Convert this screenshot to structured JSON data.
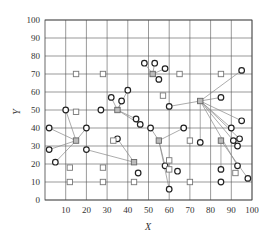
{
  "chart_data": {
    "type": "scatter",
    "title": "",
    "xlabel": "X",
    "ylabel": "Y",
    "xlim": [
      0,
      100
    ],
    "ylim": [
      0,
      100
    ],
    "x_ticks": [
      10,
      20,
      30,
      40,
      50,
      60,
      70,
      80,
      90,
      100
    ],
    "y_ticks": [
      0,
      10,
      20,
      30,
      40,
      50,
      60,
      70,
      80,
      90,
      100
    ],
    "grid": true,
    "legend": null,
    "series": [
      {
        "name": "demand points (circles)",
        "marker": "circle",
        "points": [
          [
            2,
            40
          ],
          [
            2,
            28
          ],
          [
            5,
            21
          ],
          [
            10,
            50
          ],
          [
            20,
            40
          ],
          [
            20,
            28
          ],
          [
            27,
            50
          ],
          [
            32,
            57
          ],
          [
            35,
            34
          ],
          [
            37,
            55
          ],
          [
            40,
            61
          ],
          [
            44,
            45
          ],
          [
            45,
            15
          ],
          [
            46,
            42
          ],
          [
            48,
            76
          ],
          [
            51,
            40
          ],
          [
            53,
            76
          ],
          [
            55,
            67
          ],
          [
            58,
            73
          ],
          [
            58,
            19
          ],
          [
            60,
            6
          ],
          [
            60,
            52
          ],
          [
            64,
            16
          ],
          [
            67,
            40
          ],
          [
            75,
            32
          ],
          [
            85,
            57
          ],
          [
            85,
            17
          ],
          [
            85,
            10
          ],
          [
            90,
            40
          ],
          [
            91,
            33
          ],
          [
            93,
            30
          ],
          [
            93,
            19
          ],
          [
            94,
            34
          ],
          [
            95,
            72
          ],
          [
            95,
            44
          ],
          [
            98,
            12
          ]
        ]
      },
      {
        "name": "candidate sites (open squares)",
        "marker": "square-open",
        "points": [
          [
            15,
            70
          ],
          [
            15,
            49
          ],
          [
            12,
            18
          ],
          [
            12,
            10
          ],
          [
            28,
            70
          ],
          [
            28,
            18
          ],
          [
            28,
            10
          ],
          [
            33,
            33
          ],
          [
            43,
            10
          ],
          [
            57,
            58
          ],
          [
            60,
            17
          ],
          [
            60,
            22
          ],
          [
            65,
            70
          ],
          [
            70,
            33
          ],
          [
            70,
            10
          ],
          [
            85,
            70
          ],
          [
            92,
            15
          ]
        ]
      },
      {
        "name": "selected sites (gray squares)",
        "marker": "square-filled",
        "points": [
          [
            15,
            33
          ],
          [
            35,
            50
          ],
          [
            52,
            70
          ],
          [
            55,
            33
          ],
          [
            75,
            55
          ],
          [
            85,
            33
          ],
          [
            43,
            21
          ]
        ]
      }
    ],
    "links": [
      {
        "from": [
          15,
          33
        ],
        "to": [
          [
            2,
            40
          ],
          [
            2,
            28
          ],
          [
            5,
            21
          ],
          [
            20,
            40
          ],
          [
            10,
            50
          ]
        ]
      },
      {
        "from": [
          35,
          50
        ],
        "to": [
          [
            27,
            50
          ],
          [
            32,
            57
          ],
          [
            37,
            55
          ],
          [
            40,
            61
          ],
          [
            44,
            45
          ],
          [
            46,
            42
          ]
        ]
      },
      {
        "from": [
          52,
          70
        ],
        "to": [
          [
            48,
            76
          ],
          [
            53,
            76
          ],
          [
            58,
            73
          ],
          [
            55,
            67
          ]
        ]
      },
      {
        "from": [
          55,
          33
        ],
        "to": [
          [
            51,
            40
          ],
          [
            67,
            40
          ],
          [
            58,
            19
          ],
          [
            60,
            6
          ]
        ]
      },
      {
        "from": [
          75,
          55
        ],
        "to": [
          [
            60,
            52
          ],
          [
            85,
            57
          ],
          [
            95,
            72
          ],
          [
            95,
            44
          ],
          [
            90,
            40
          ],
          [
            91,
            33
          ],
          [
            94,
            34
          ],
          [
            93,
            19
          ],
          [
            75,
            32
          ]
        ]
      },
      {
        "from": [
          85,
          33
        ],
        "to": [
          [
            85,
            17
          ],
          [
            98,
            12
          ]
        ]
      },
      {
        "from": [
          43,
          21
        ],
        "to": [
          [
            20,
            28
          ],
          [
            35,
            34
          ]
        ]
      }
    ]
  }
}
